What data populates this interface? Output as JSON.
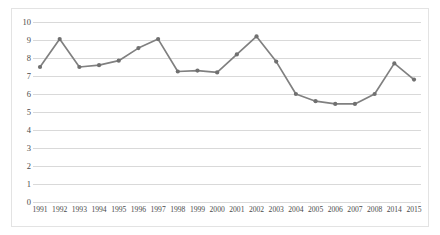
{
  "chart_data": {
    "type": "line",
    "title": "",
    "subtitle": "",
    "xlabel": "",
    "ylabel": "",
    "grid": true,
    "legend": false,
    "legend_position": "none",
    "line_color": "#808080",
    "marker_color": "#707070",
    "gridline_color": "#d9d9d9",
    "border_color": "#e3e3e3",
    "background_color": "#ffffff",
    "ylim": [
      0,
      10
    ],
    "ytick_step": 1,
    "yticks": [
      "10",
      "9",
      "8",
      "7",
      "6",
      "5",
      "4",
      "3",
      "2",
      "1",
      "0"
    ],
    "categories": [
      "1991",
      "1992",
      "1993",
      "1994",
      "1995",
      "1996",
      "1997",
      "1998",
      "1999",
      "2000",
      "2001",
      "2002",
      "2003",
      "2004",
      "2005",
      "2006",
      "2007",
      "2008",
      "2014",
      "2015"
    ],
    "series": [
      {
        "name": "series-1",
        "values": [
          7.5,
          9.05,
          7.5,
          7.6,
          7.85,
          8.55,
          9.05,
          7.25,
          7.3,
          7.2,
          8.2,
          9.2,
          7.8,
          6.0,
          5.6,
          5.45,
          5.45,
          6.0,
          7.7,
          6.8
        ]
      }
    ]
  }
}
